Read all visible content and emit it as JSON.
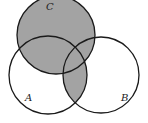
{
  "diagram": {
    "type": "venn",
    "shaded_region": "C ∪ (A ∩ B)",
    "colors": {
      "shade": "#a3a3a3",
      "stroke": "#1a1a1a",
      "background": "#ffffff"
    },
    "circles": [
      {
        "id": "A",
        "label": "A",
        "cx": 48,
        "cy": 75,
        "r": 39,
        "label_x": 25,
        "label_y": 101
      },
      {
        "id": "B",
        "label": "B",
        "cx": 101,
        "cy": 75,
        "r": 38,
        "label_x": 121,
        "label_y": 101
      },
      {
        "id": "C",
        "label": "C",
        "cx": 56,
        "cy": 35,
        "r": 39,
        "label_x": 46,
        "label_y": 10
      }
    ]
  }
}
